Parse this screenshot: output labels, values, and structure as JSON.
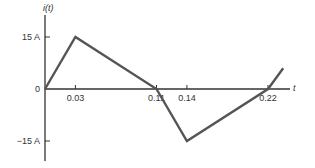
{
  "chart_data": {
    "type": "line",
    "title": "",
    "xlabel": "t",
    "ylabel": "i(t)",
    "x": [
      0,
      0.03,
      0.11,
      0.14,
      0.22,
      0.235
    ],
    "series": [
      {
        "name": "i(t)",
        "values": [
          0,
          15,
          0,
          -15,
          0,
          6
        ]
      }
    ],
    "x_ticks": [
      0.03,
      0.11,
      0.14,
      0.22
    ],
    "x_tick_labels": [
      "0.03",
      "0.11",
      "0.14",
      "0.22"
    ],
    "y_ticks": [
      15,
      0,
      -15
    ],
    "y_tick_labels": [
      "15 A",
      "0",
      "−15 A"
    ],
    "xlim": [
      0,
      0.24
    ],
    "ylim": [
      -20,
      22
    ],
    "grid": false,
    "line_color": "#555555",
    "axis_color": "#333333"
  }
}
